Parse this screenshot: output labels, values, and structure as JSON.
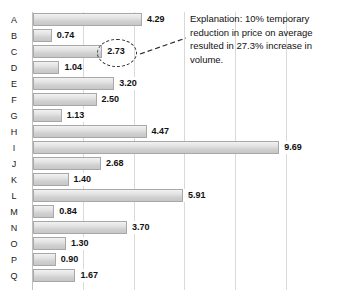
{
  "chart_data": {
    "type": "bar",
    "orientation": "horizontal",
    "title": "",
    "subtitle": "",
    "xlabel": "",
    "ylabel": "",
    "xlim": [
      0,
      10.5
    ],
    "grid": true,
    "grid_axis": "x",
    "grid_step": 2,
    "legend": "none",
    "value_label_format": "0.00",
    "categories": [
      "A",
      "B",
      "C",
      "D",
      "E",
      "F",
      "G",
      "H",
      "I",
      "J",
      "K",
      "L",
      "M",
      "N",
      "O",
      "P",
      "Q"
    ],
    "values": [
      4.29,
      0.74,
      2.73,
      1.04,
      3.2,
      2.5,
      1.13,
      4.47,
      9.69,
      2.68,
      1.4,
      5.91,
      0.84,
      3.7,
      1.3,
      0.9,
      1.67
    ],
    "value_labels": [
      "4.29",
      "0.74",
      "2.73",
      "1.04",
      "3.20",
      "2.50",
      "1.13",
      "4.47",
      "9.69",
      "2.68",
      "1.40",
      "5.91",
      "0.84",
      "3.70",
      "1.30",
      "0.90",
      "1.67"
    ],
    "annotations": [
      {
        "type": "highlight-ellipse",
        "target_category": "C",
        "target_value": 2.73,
        "text": "Explanation: 10% temporary reduction in price on average resulted in 27.3% increase in volume."
      }
    ],
    "colors": {
      "bar_fill_light": "#f2f2f2",
      "bar_fill_dark": "#c6c6c6",
      "bar_border": "#a8a8a8",
      "gridline": "#d9d9d9",
      "axis": "#bfbfbf",
      "text": "#111111",
      "annotation": "#2b2b2b",
      "background": "#ffffff"
    }
  },
  "annotation": {
    "explanation_text": "Explanation: 10% temporary reduction in price on average resulted in 27.3% increase in volume."
  }
}
